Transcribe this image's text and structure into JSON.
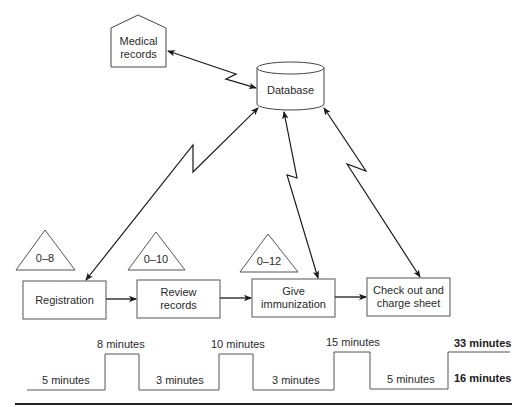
{
  "diagram": {
    "type": "value-stream-map",
    "information_nodes": {
      "medical_records": {
        "label": "Medical\nrecords",
        "shape": "pentagon"
      },
      "database": {
        "label": "Database",
        "shape": "cylinder"
      }
    },
    "inventory_triangles": [
      {
        "label": "0–8"
      },
      {
        "label": "0–10"
      },
      {
        "label": "0–12"
      }
    ],
    "processes": [
      {
        "label": "Registration"
      },
      {
        "label": "Review\nrecords"
      },
      {
        "label": "Give\nimmunization"
      },
      {
        "label": "Check out and\ncharge sheet"
      }
    ],
    "connections": [
      {
        "from": "Medical records",
        "to": "Database",
        "type": "electronic",
        "bidirectional": true
      },
      {
        "from": "Database",
        "to": "Registration",
        "type": "electronic",
        "bidirectional": true
      },
      {
        "from": "Database",
        "to": "Give immunization",
        "type": "electronic",
        "bidirectional": true
      },
      {
        "from": "Database",
        "to": "Check out and charge sheet",
        "type": "electronic",
        "bidirectional": true
      },
      {
        "from": "Registration",
        "to": "Review records",
        "type": "push"
      },
      {
        "from": "Review records",
        "to": "Give immunization",
        "type": "push"
      },
      {
        "from": "Give immunization",
        "to": "Check out and charge sheet",
        "type": "push"
      }
    ],
    "timeline": {
      "low_segments": [
        "5 minutes",
        "3 minutes",
        "3 minutes",
        "5 minutes"
      ],
      "high_segments": [
        "8 minutes",
        "10 minutes",
        "15 minutes"
      ],
      "totals": {
        "high": "33 minutes",
        "low": "16 minutes"
      }
    },
    "colors": {
      "stroke": "#222222",
      "background": "#ffffff"
    }
  }
}
